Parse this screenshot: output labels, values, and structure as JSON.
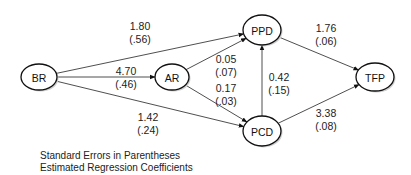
{
  "diagram": {
    "type": "path-diagram",
    "nodes": [
      {
        "id": "BR",
        "label": "BR",
        "cx": 39,
        "cy": 77,
        "rx": 18,
        "ry": 13
      },
      {
        "id": "AR",
        "label": "AR",
        "cx": 172,
        "cy": 77,
        "rx": 17,
        "ry": 13
      },
      {
        "id": "PPD",
        "label": "PPD",
        "cx": 262,
        "cy": 30,
        "rx": 19,
        "ry": 15
      },
      {
        "id": "PCD",
        "label": "PCD",
        "cx": 262,
        "cy": 131,
        "rx": 19,
        "ry": 15
      },
      {
        "id": "TFP",
        "label": "TFP",
        "cx": 375,
        "cy": 77,
        "rx": 19,
        "ry": 14
      }
    ],
    "edges": [
      {
        "from": "BR",
        "to": "PPD",
        "coef": "1.80",
        "se": "(.56)",
        "lx": 140,
        "ly": 30
      },
      {
        "from": "BR",
        "to": "AR",
        "coef": "4.70",
        "se": "(.46)",
        "lx": 126,
        "ly": 75
      },
      {
        "from": "BR",
        "to": "PCD",
        "coef": "1.42",
        "se": "(.24)",
        "lx": 148,
        "ly": 121
      },
      {
        "from": "AR",
        "to": "PPD",
        "coef": "0.05",
        "se": "(.07)",
        "lx": 226,
        "ly": 63
      },
      {
        "from": "AR",
        "to": "PCD",
        "coef": "0.17",
        "se": "(.03)",
        "lx": 226,
        "ly": 92
      },
      {
        "from": "PCD",
        "to": "PPD",
        "coef": "0.42",
        "se": "(.15)",
        "lx": 279,
        "ly": 81
      },
      {
        "from": "PPD",
        "to": "TFP",
        "coef": "1.76",
        "se": "(.06)",
        "lx": 326,
        "ly": 32
      },
      {
        "from": "PCD",
        "to": "TFP",
        "coef": "3.38",
        "se": "(.08)",
        "lx": 326,
        "ly": 117
      }
    ],
    "colors": {
      "line": "#222222",
      "node_fill": "#ffffff",
      "node_stroke": "#111111",
      "background": "#ffffff"
    }
  },
  "legend": {
    "line1": "Standard Errors in Parentheses",
    "line2": "Estimated Regression Coefficients"
  }
}
